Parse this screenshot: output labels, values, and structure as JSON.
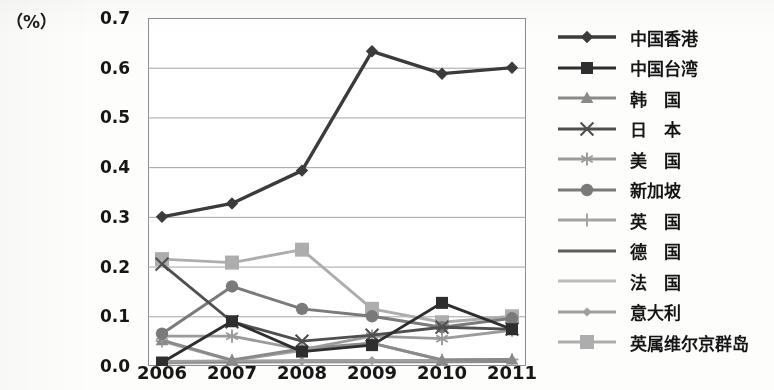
{
  "axis": {
    "unit_label": "（%）",
    "y_ticks": [
      "0.7",
      "0.6",
      "0.5",
      "0.4",
      "0.3",
      "0.2",
      "0.1",
      "0.0"
    ],
    "x_ticks": [
      "2006",
      "2007",
      "2008",
      "2009",
      "2010",
      "2011"
    ]
  },
  "chart_data": {
    "type": "line",
    "title": "",
    "xlabel": "",
    "ylabel": "（%）",
    "ylim": [
      0.0,
      0.7
    ],
    "grid": true,
    "legend_position": "right",
    "x": [
      "2006",
      "2007",
      "2008",
      "2009",
      "2010",
      "2011"
    ],
    "categories": [
      "2006",
      "2007",
      "2008",
      "2009",
      "2010",
      "2011"
    ],
    "series": [
      {
        "name": "中国香港",
        "marker": "diamond",
        "color": "#3b3b3b",
        "values": [
          0.3,
          0.327,
          0.393,
          0.633,
          0.588,
          0.6
        ]
      },
      {
        "name": "中国台湾",
        "marker": "square",
        "color": "#2e2e2e",
        "values": [
          0.007,
          0.09,
          0.029,
          0.042,
          0.127,
          0.074
        ]
      },
      {
        "name": "韩　国",
        "marker": "triangle",
        "color": "#8a8a8a",
        "values": [
          0.052,
          0.012,
          0.035,
          0.046,
          0.012,
          0.013
        ]
      },
      {
        "name": "日　本",
        "marker": "x",
        "color": "#4f4f4f",
        "values": [
          0.205,
          0.089,
          0.05,
          0.062,
          0.078,
          0.074
        ]
      },
      {
        "name": "美　国",
        "marker": "asterisk",
        "color": "#9b9b9b",
        "values": [
          0.06,
          0.06,
          0.033,
          0.06,
          0.055,
          0.072
        ]
      },
      {
        "name": "新加坡",
        "marker": "circle",
        "color": "#7a7a7a",
        "values": [
          0.065,
          0.16,
          0.115,
          0.1,
          0.078,
          0.096
        ]
      },
      {
        "name": "英　国",
        "marker": "plus",
        "color": "#a3a3a3",
        "values": [
          0.05,
          0.011,
          0.031,
          0.046,
          0.012,
          0.013
        ]
      },
      {
        "name": "德　国",
        "marker": "none",
        "color": "#5c5c5c",
        "values": [
          0.008,
          0.009,
          0.01,
          0.01,
          0.01,
          0.01
        ]
      },
      {
        "name": "法　国",
        "marker": "none",
        "color": "#bcbcbc",
        "values": [
          0.006,
          0.007,
          0.008,
          0.008,
          0.008,
          0.009
        ]
      },
      {
        "name": "意大利",
        "marker": "diamond-sm",
        "color": "#9f9f9f",
        "values": [
          0.009,
          0.01,
          0.01,
          0.011,
          0.011,
          0.012
        ]
      },
      {
        "name": "英属维尔京群岛",
        "marker": "square-lt",
        "color": "#adadad",
        "values": [
          0.215,
          0.208,
          0.234,
          0.115,
          0.088,
          0.1
        ]
      }
    ]
  },
  "legend": {
    "items": [
      {
        "label": "中国香港"
      },
      {
        "label": "中国台湾"
      },
      {
        "label": "韩　国"
      },
      {
        "label": "日　本"
      },
      {
        "label": "美　国"
      },
      {
        "label": "新加坡"
      },
      {
        "label": "英　国"
      },
      {
        "label": "德　国"
      },
      {
        "label": "法　国"
      },
      {
        "label": "意大利"
      },
      {
        "label": "英属维尔京群岛"
      }
    ]
  }
}
